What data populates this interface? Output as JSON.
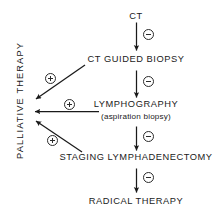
{
  "figure": {
    "kind": "clinical-decision-flowchart",
    "width": 222,
    "height": 216,
    "background_color": "#ffffff",
    "ink_color": "#1a1a1a"
  },
  "nodes": {
    "ct": "CT",
    "ct_guided_biopsy": "CT GUIDED BIOPSY",
    "lymphography": "LYMPHOGRAPHY",
    "lymphography_sub": "(aspiration biopsy)",
    "staging_lymphadenectomy": "STAGING LYMPHADENECTOMY",
    "radical_therapy": "RADICAL THERAPY",
    "palliative_therapy": "PALLIATIVE THERAPY"
  },
  "signs": {
    "minus": "−",
    "plus": "+",
    "minus_label": "negative-result",
    "plus_label": "positive-result"
  },
  "edges": [
    {
      "id": "ct-to-ct-guided-biopsy",
      "from": "CT",
      "to": "CT GUIDED BIOPSY",
      "sign": "−",
      "direction": "down"
    },
    {
      "id": "ct-guided-biopsy-to-lymphography",
      "from": "CT GUIDED BIOPSY",
      "to": "LYMPHOGRAPHY",
      "sign": "−",
      "direction": "down"
    },
    {
      "id": "lymphography-to-staging-lymphadenectomy",
      "from": "LYMPHOGRAPHY",
      "to": "STAGING LYMPHADENECTOMY",
      "sign": "−",
      "direction": "down"
    },
    {
      "id": "staging-lymphadenectomy-to-radical-therapy",
      "from": "STAGING LYMPHADENECTOMY",
      "to": "RADICAL THERAPY",
      "sign": "−",
      "direction": "down"
    },
    {
      "id": "ct-guided-biopsy-to-palliative-therapy",
      "from": "CT GUIDED BIOPSY",
      "to": "PALLIATIVE THERAPY",
      "sign": "+",
      "direction": "down-left-diagonal"
    },
    {
      "id": "lymphography-to-palliative-therapy",
      "from": "LYMPHOGRAPHY",
      "to": "PALLIATIVE THERAPY",
      "sign": "+",
      "direction": "left"
    },
    {
      "id": "staging-lymphadenectomy-to-palliative-therapy",
      "from": "STAGING LYMPHADENECTOMY",
      "to": "PALLIATIVE THERAPY",
      "sign": "+",
      "direction": "up-left-diagonal"
    }
  ]
}
